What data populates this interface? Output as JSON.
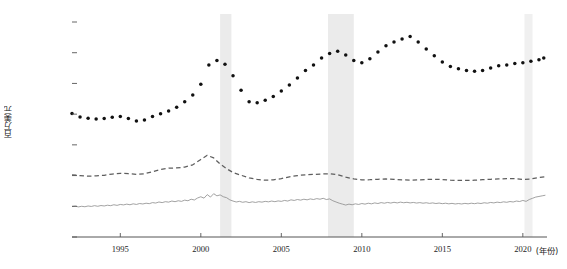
{
  "chart_data": {
    "type": "line",
    "title": "",
    "subtitle": "",
    "xlabel": "(年份)",
    "ylabel": "百万美元",
    "xlim": [
      1992.0,
      2021.5
    ],
    "ylim": [
      0,
      140000
    ],
    "grid": false,
    "legend": "none",
    "x_ticks": [
      1995,
      2000,
      2005,
      2010,
      2015,
      2020
    ],
    "x_tick_labels": [
      "1995",
      "2000",
      "2005",
      "2010",
      "2015",
      "2020"
    ],
    "y_ticks": [
      0,
      20000,
      40000,
      60000,
      80000,
      100000,
      120000,
      140000
    ],
    "y_tick_labels": [
      "0",
      "20 000",
      "40 000",
      "60 000",
      "80 000",
      "100 000",
      "120 000",
      "140 000"
    ],
    "shaded_regions": [
      {
        "name": "recession-2001",
        "x0": 2001.2,
        "x1": 2001.9,
        "color": "#ebebeb"
      },
      {
        "name": "recession-2008",
        "x0": 2007.9,
        "x1": 2009.5,
        "color": "#ebebeb"
      },
      {
        "name": "recession-2020",
        "x0": 2020.1,
        "x1": 2020.6,
        "color": "#f0f0f0"
      }
    ],
    "series": [
      {
        "name": "series-dotted",
        "style": "dotted",
        "marker": "circle",
        "color": "#111111",
        "x": [
          1992.0,
          1992.5,
          1993.0,
          1993.5,
          1994.0,
          1994.5,
          1995.0,
          1995.5,
          1996.0,
          1996.5,
          1997.0,
          1997.5,
          1998.0,
          1998.5,
          1999.0,
          1999.5,
          2000.0,
          2000.5,
          2001.0,
          2001.5,
          2002.0,
          2002.5,
          2003.0,
          2003.5,
          2004.0,
          2004.5,
          2005.0,
          2005.5,
          2006.0,
          2006.5,
          2007.0,
          2007.5,
          2008.0,
          2008.5,
          2009.0,
          2009.5,
          2010.0,
          2010.5,
          2011.0,
          2011.5,
          2012.0,
          2012.5,
          2013.0,
          2013.5,
          2014.0,
          2014.5,
          2015.0,
          2015.5,
          2016.0,
          2016.5,
          2017.0,
          2017.5,
          2018.0,
          2018.5,
          2019.0,
          2019.5,
          2020.0,
          2020.5,
          2021.0,
          2021.3
        ],
        "y": [
          80500,
          78200,
          77400,
          76800,
          77200,
          78000,
          78400,
          77200,
          75600,
          76200,
          78500,
          80200,
          82000,
          84500,
          88000,
          92500,
          99500,
          112000,
          115000,
          112500,
          105000,
          95500,
          88000,
          87500,
          89000,
          91500,
          95000,
          99000,
          103500,
          108500,
          112000,
          116500,
          119500,
          121000,
          118500,
          115000,
          113500,
          116000,
          120500,
          124500,
          127000,
          129000,
          130500,
          127000,
          122500,
          118000,
          114000,
          111000,
          109500,
          108500,
          108000,
          108500,
          110000,
          111500,
          112000,
          113000,
          113500,
          114500,
          115500,
          116500
        ]
      },
      {
        "name": "series-dashed",
        "style": "dashed",
        "color": "#5e5e5e",
        "x": [
          1992.0,
          1992.5,
          1993.0,
          1993.5,
          1994.0,
          1994.5,
          1995.0,
          1995.5,
          1996.0,
          1996.5,
          1997.0,
          1997.5,
          1998.0,
          1998.5,
          1999.0,
          1999.5,
          2000.0,
          2000.4,
          2000.8,
          2001.2,
          2001.6,
          2002.0,
          2002.5,
          2003.0,
          2003.5,
          2004.0,
          2004.5,
          2005.0,
          2005.5,
          2006.0,
          2006.5,
          2007.0,
          2007.5,
          2008.0,
          2008.5,
          2009.0,
          2009.5,
          2010.0,
          2010.5,
          2011.0,
          2011.5,
          2012.0,
          2012.5,
          2013.0,
          2013.5,
          2014.0,
          2014.5,
          2015.0,
          2015.5,
          2016.0,
          2016.5,
          2017.0,
          2017.5,
          2018.0,
          2018.5,
          2019.0,
          2019.5,
          2020.0,
          2020.5,
          2021.0,
          2021.4
        ],
        "y": [
          40500,
          40000,
          39600,
          39800,
          40200,
          41000,
          41500,
          41200,
          40800,
          41200,
          42500,
          44000,
          44800,
          45000,
          45500,
          47000,
          50500,
          53200,
          51500,
          47500,
          44500,
          42000,
          40200,
          38500,
          37500,
          37000,
          37200,
          38000,
          39200,
          40000,
          40500,
          40800,
          41000,
          41200,
          40500,
          39000,
          37800,
          37200,
          37300,
          37600,
          37800,
          37500,
          37200,
          37000,
          37200,
          37500,
          37600,
          37400,
          37000,
          36800,
          36800,
          37000,
          37300,
          37600,
          37800,
          38000,
          38000,
          37500,
          37800,
          38800,
          39200
        ]
      },
      {
        "name": "series-solid",
        "style": "solid",
        "color": "#8a8a8a",
        "x": [
          1992.0,
          1992.2,
          1992.4,
          1992.6,
          1992.8,
          1993.0,
          1993.2,
          1993.4,
          1993.6,
          1993.8,
          1994.0,
          1994.2,
          1994.4,
          1994.6,
          1994.8,
          1995.0,
          1995.2,
          1995.4,
          1995.6,
          1995.8,
          1996.0,
          1996.2,
          1996.4,
          1996.6,
          1996.8,
          1997.0,
          1997.2,
          1997.4,
          1997.6,
          1997.8,
          1998.0,
          1998.2,
          1998.4,
          1998.6,
          1998.8,
          1999.0,
          1999.2,
          1999.4,
          1999.6,
          1999.8,
          2000.0,
          2000.2,
          2000.4,
          2000.6,
          2000.8,
          2001.0,
          2001.2,
          2001.4,
          2001.6,
          2001.8,
          2002.0,
          2002.2,
          2002.4,
          2002.6,
          2002.8,
          2003.0,
          2003.2,
          2003.4,
          2003.6,
          2003.8,
          2004.0,
          2004.2,
          2004.4,
          2004.6,
          2004.8,
          2005.0,
          2005.2,
          2005.4,
          2005.6,
          2005.8,
          2006.0,
          2006.2,
          2006.4,
          2006.6,
          2006.8,
          2007.0,
          2007.2,
          2007.4,
          2007.6,
          2007.8,
          2008.0,
          2008.2,
          2008.4,
          2008.6,
          2008.8,
          2009.0,
          2009.2,
          2009.4,
          2009.6,
          2009.8,
          2010.0,
          2010.2,
          2010.4,
          2010.6,
          2010.8,
          2011.0,
          2011.2,
          2011.4,
          2011.6,
          2011.8,
          2012.0,
          2012.2,
          2012.4,
          2012.6,
          2012.8,
          2013.0,
          2013.2,
          2013.4,
          2013.6,
          2013.8,
          2014.0,
          2014.2,
          2014.4,
          2014.6,
          2014.8,
          2015.0,
          2015.2,
          2015.4,
          2015.6,
          2015.8,
          2016.0,
          2016.2,
          2016.4,
          2016.6,
          2016.8,
          2017.0,
          2017.2,
          2017.4,
          2017.6,
          2017.8,
          2018.0,
          2018.2,
          2018.4,
          2018.6,
          2018.8,
          2019.0,
          2019.2,
          2019.4,
          2019.6,
          2019.8,
          2020.0,
          2020.2,
          2020.4,
          2020.6,
          2020.8,
          2021.0,
          2021.2,
          2021.4
        ],
        "y": [
          19800,
          20100,
          19600,
          20000,
          19700,
          20200,
          19900,
          20400,
          20000,
          20500,
          20200,
          20700,
          20400,
          21000,
          20600,
          21200,
          20900,
          21400,
          21000,
          21600,
          21200,
          21800,
          21500,
          22000,
          21700,
          22400,
          22100,
          22800,
          22400,
          23000,
          22700,
          23400,
          23000,
          23600,
          23200,
          24000,
          23600,
          24600,
          24100,
          25400,
          26200,
          25300,
          27600,
          26000,
          28200,
          26800,
          27400,
          26200,
          25600,
          24200,
          23400,
          22800,
          23200,
          22600,
          23000,
          22400,
          22900,
          22500,
          23000,
          22700,
          23200,
          22900,
          23400,
          23000,
          23500,
          23200,
          23800,
          23400,
          24200,
          23800,
          24400,
          24000,
          24600,
          24200,
          24800,
          24400,
          25000,
          24600,
          25200,
          24400,
          24800,
          23600,
          22800,
          22000,
          21400,
          20800,
          21400,
          21000,
          21600,
          21200,
          21800,
          21400,
          22000,
          21600,
          22200,
          21800,
          22400,
          22000,
          22500,
          22100,
          22600,
          22200,
          22700,
          22300,
          22600,
          22200,
          22500,
          22100,
          22400,
          22000,
          22300,
          21900,
          22200,
          21800,
          22100,
          21700,
          22000,
          21600,
          21900,
          21500,
          21800,
          21500,
          21900,
          21600,
          22000,
          21700,
          22100,
          21800,
          22300,
          22000,
          22500,
          22200,
          22700,
          22400,
          22900,
          22600,
          23100,
          22800,
          23400,
          23100,
          23800,
          23200,
          24400,
          25200,
          26000,
          26400,
          26800,
          27200
        ]
      }
    ]
  }
}
